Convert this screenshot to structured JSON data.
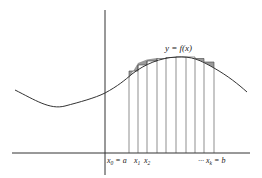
{
  "diagram": {
    "curve_label": "y = f(x)",
    "x_labels": [
      {
        "text": "x",
        "sub": "0",
        "suffix": " = a"
      },
      {
        "text": "x",
        "sub": "1",
        "suffix": ""
      },
      {
        "text": "x",
        "sub": "2",
        "suffix": ""
      },
      {
        "text": "··· x",
        "sub": "k",
        "suffix": " = b"
      }
    ],
    "num_subintervals": 10,
    "colors": {
      "line": "#333333",
      "shade": "#999999",
      "background": "#ffffff"
    }
  }
}
